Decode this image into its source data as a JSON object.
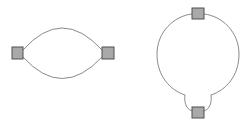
{
  "diagrams": [
    {
      "id": "two-node-lens",
      "nodes": [
        {
          "id": "left",
          "x": 12,
          "y": 47,
          "w": 11,
          "h": 12
        },
        {
          "id": "right",
          "x": 102,
          "y": 47,
          "w": 12,
          "h": 12
        }
      ],
      "edges": [
        {
          "id": "top-arc",
          "from": "left",
          "to": "right"
        },
        {
          "id": "bottom-arc",
          "from": "left",
          "to": "right"
        }
      ]
    },
    {
      "id": "loop-with-pinched-bottom",
      "nodes": [
        {
          "id": "top",
          "x": 192,
          "y": 8,
          "w": 12,
          "h": 11
        },
        {
          "id": "bottom",
          "x": 192,
          "y": 107,
          "w": 12,
          "h": 11
        }
      ],
      "edges": [
        {
          "id": "circle-loop",
          "from": "top",
          "to": "bottom"
        }
      ]
    }
  ],
  "colors": {
    "background": "#ffffff",
    "edge": "#8a8a8a",
    "node_fill": "#a9a9a9",
    "node_stroke": "#505050"
  }
}
